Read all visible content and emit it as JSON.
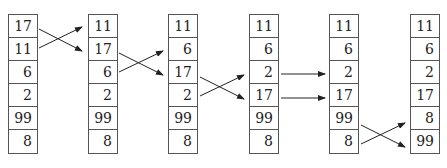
{
  "diagram": {
    "columns": [
      {
        "values": [
          "17",
          "11",
          "6",
          "2",
          "99",
          "8"
        ]
      },
      {
        "values": [
          "11",
          "17",
          "6",
          "2",
          "99",
          "8"
        ]
      },
      {
        "values": [
          "11",
          "6",
          "17",
          "2",
          "99",
          "8"
        ]
      },
      {
        "values": [
          "11",
          "6",
          "2",
          "17",
          "99",
          "8"
        ]
      },
      {
        "values": [
          "11",
          "6",
          "2",
          "17",
          "99",
          "8"
        ]
      },
      {
        "values": [
          "11",
          "6",
          "2",
          "17",
          "8",
          "99"
        ]
      }
    ],
    "transitions": [
      {
        "from_col": 0,
        "to_col": 1,
        "type": "swap",
        "rows": [
          0,
          1
        ]
      },
      {
        "from_col": 1,
        "to_col": 2,
        "type": "swap",
        "rows": [
          1,
          2
        ]
      },
      {
        "from_col": 2,
        "to_col": 3,
        "type": "swap",
        "rows": [
          2,
          3
        ]
      },
      {
        "from_col": 3,
        "to_col": 4,
        "type": "straight",
        "rows": [
          2,
          3
        ]
      },
      {
        "from_col": 4,
        "to_col": 5,
        "type": "swap",
        "rows": [
          4,
          5
        ]
      }
    ],
    "colors": {
      "line": "#222222",
      "border": "#555555",
      "text": "#222222"
    }
  }
}
